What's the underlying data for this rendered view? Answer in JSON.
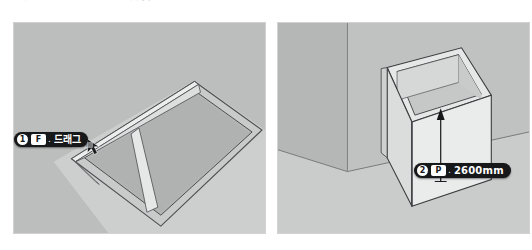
{
  "page": {
    "top_caption": "ᄀ  ᄂ  ᄃᄅ        ᄆᄇ  ᄉᄋ  ᄌᄎ",
    "background_color": "#ffffff"
  },
  "colors": {
    "panel_bg": "#b9bbbb",
    "panel_border": "#d2d2d2",
    "floor": "#c4c6c6",
    "wall_light": "#e9eaea",
    "wall_mid": "#d5d7d7",
    "wall_dark": "#b0b2b2",
    "outline": "#3a3c3e",
    "badge_bg": "#17181a",
    "badge_fg": "#ffffff",
    "arrow": "#1a1a1a"
  },
  "panels": [
    {
      "id": "left",
      "name": "floor-rectangle-view",
      "scene": "rectangle drawn on ground plane with offset inner frame, cursor dragging corner",
      "callout": {
        "step": "1",
        "key": "F",
        "separator": ".",
        "text": "드래그"
      },
      "tooltip": "꼭지점에서"
    },
    {
      "id": "right",
      "name": "extruded-walls-view",
      "scene": "rectangular walls extruded upward from the floor outline, vertical arrow showing push/pull height",
      "callout": {
        "step": "2",
        "key": "P",
        "separator": ".",
        "text": "2600mm"
      },
      "arrow": {
        "name": "extrude-height-arrow",
        "direction": "up",
        "label": "2600mm"
      }
    }
  ]
}
